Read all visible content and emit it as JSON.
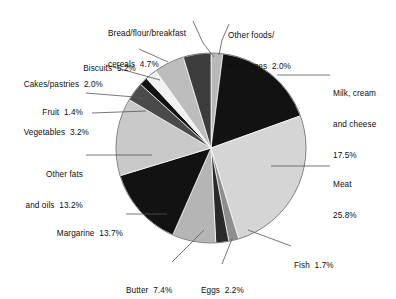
{
  "chart_data": {
    "type": "pie",
    "title": "",
    "subtitle": "",
    "xlabel": "",
    "ylabel": "",
    "legend_position": "none",
    "grid": false,
    "units": "percent",
    "start_angle_deg": 0,
    "direction": "clockwise",
    "categories": [
      "Other foods/beverages",
      "Milk, cream and cheese",
      "Meat",
      "Fish",
      "Eggs",
      "Butter",
      "Margarine",
      "Other fats and oils",
      "Vegetables",
      "Fruit",
      "Cakes/pastries",
      "Biscuits",
      "Bread/flour/breakfast cereals"
    ],
    "values": [
      2.0,
      17.5,
      25.8,
      1.7,
      2.2,
      7.4,
      13.7,
      13.2,
      3.2,
      1.4,
      2.0,
      5.2,
      4.7
    ],
    "total": 100.0,
    "slices": [
      {
        "label": "Other foods/ beverages",
        "value": 2.0,
        "value_text": "2.0%",
        "color": "#b8b8b8"
      },
      {
        "label": "Milk, cream and cheese",
        "value": 17.5,
        "value_text": "17.5%",
        "color": "#121212"
      },
      {
        "label": "Meat",
        "value": 25.8,
        "value_text": "25.8%",
        "color": "#d5d5d5"
      },
      {
        "label": "Fish",
        "value": 1.7,
        "value_text": "1.7%",
        "color": "#8e8e8e"
      },
      {
        "label": "Eggs",
        "value": 2.2,
        "value_text": "2.2%",
        "color": "#2a2a2a"
      },
      {
        "label": "Butter",
        "value": 7.4,
        "value_text": "7.4%",
        "color": "#b5b5b5"
      },
      {
        "label": "Margarine",
        "value": 13.7,
        "value_text": "13.7%",
        "color": "#121212"
      },
      {
        "label": "Other fats and oils",
        "value": 13.2,
        "value_text": "13.2%",
        "color": "#c9c9c9"
      },
      {
        "label": "Vegetables",
        "value": 3.2,
        "value_text": "3.2%",
        "color": "#4a4a4a"
      },
      {
        "label": "Fruit",
        "value": 1.4,
        "value_text": "1.4%",
        "color": "#121212"
      },
      {
        "label": "Cakes/pastries",
        "value": 2.0,
        "value_text": "2.0%",
        "color": "#f2f2f2"
      },
      {
        "label": "Biscuits",
        "value": 5.2,
        "value_text": "5.2%",
        "color": "#bdbdbd"
      },
      {
        "label": "Bread/flour/breakfast cereals",
        "value": 4.7,
        "value_text": "4.7%",
        "color": "#3c3c3c"
      }
    ]
  },
  "labels": {
    "bread": {
      "line1": "Bread/flour/breakfast",
      "line2": "cereals  4.7%"
    },
    "other_foods": {
      "line1": "Other foods/",
      "line2": "beverages  2.0%"
    },
    "milk": {
      "line1": "Milk, cream",
      "line2": "and cheese",
      "line3": "17.5%"
    },
    "biscuits": {
      "line1": "Biscuits  5.2%"
    },
    "cakes": {
      "line1": "Cakes/pastries  2.0%"
    },
    "fruit": {
      "line1": "Fruit  1.4%"
    },
    "vegetables": {
      "line1": "Vegetables  3.2%"
    },
    "other_fats": {
      "line1": "Other fats",
      "line2": "and oils  13.2%"
    },
    "margarine": {
      "line1": "Margarine  13.7%"
    },
    "meat": {
      "line1": "Meat",
      "line2": "25.8%"
    },
    "fish": {
      "line1": "Fish  1.7%"
    },
    "eggs": {
      "line1": "Eggs  2.2%"
    },
    "butter": {
      "line1": "Butter  7.4%"
    }
  },
  "style": {
    "background": "#ffffff",
    "text_color": "#0d0d0d",
    "leader_color": "#555555",
    "outline_color": "#6e6e6e"
  }
}
